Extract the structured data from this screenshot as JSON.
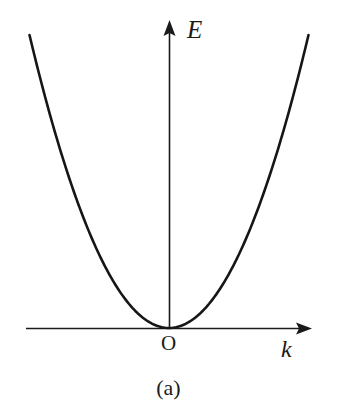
{
  "figure": {
    "caption": "(a)",
    "background_color": "#ffffff",
    "ink_color": "#1a1a1a",
    "width": 337,
    "height": 417
  },
  "labels": {
    "y_axis": "E",
    "x_axis": "k",
    "origin": "O"
  },
  "icons": {
    "y_axis_arrowhead": "arrow-up-icon",
    "x_axis_arrowhead": "arrow-right-icon"
  },
  "chart_data": {
    "type": "line",
    "title": "(a)",
    "xlabel": "k",
    "ylabel": "E",
    "grid": false,
    "legend": null,
    "annotations": [
      {
        "text": "O",
        "x": 0,
        "y": 0,
        "note": "origin marker label below axis intersection"
      }
    ],
    "axes": {
      "x": {
        "label": "k",
        "arrow": true,
        "origin_px": 169,
        "line_y_px": 328,
        "start_px": 26,
        "end_px": 312,
        "ticks": [],
        "tick_labels": []
      },
      "y": {
        "label": "E",
        "arrow": true,
        "origin_px": 328,
        "line_x_px": 169,
        "start_px": 328,
        "end_px": 20,
        "ticks": [],
        "tick_labels": []
      }
    },
    "series": [
      {
        "name": "E(k) parabolic dispersion",
        "shape": "parabola",
        "equation": "E = a * k^2",
        "vertex": [
          0,
          0
        ],
        "symmetric": true,
        "x": [
          -1.0,
          -0.9,
          -0.8,
          -0.7,
          -0.6,
          -0.5,
          -0.4,
          -0.3,
          -0.2,
          -0.1,
          0.0,
          0.1,
          0.2,
          0.3,
          0.4,
          0.5,
          0.6,
          0.7,
          0.8,
          0.9,
          1.0
        ],
        "values": [
          1.0,
          0.81,
          0.64,
          0.49,
          0.36,
          0.25,
          0.16,
          0.09,
          0.04,
          0.01,
          0.0,
          0.01,
          0.04,
          0.09,
          0.16,
          0.25,
          0.36,
          0.49,
          0.64,
          0.81,
          1.0
        ]
      }
    ],
    "xlim": [
      -1.05,
      1.05
    ],
    "ylim": [
      0,
      1.05
    ]
  }
}
